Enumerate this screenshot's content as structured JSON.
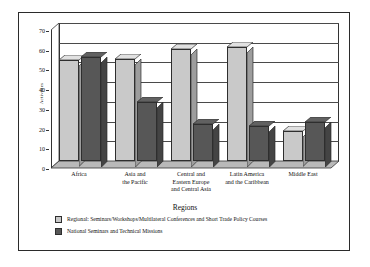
{
  "chart_data": {
    "type": "bar",
    "title": "",
    "xlabel": "Regions",
    "ylabel": "Activities",
    "ylim": [
      0,
      70
    ],
    "yticks": [
      0,
      10,
      20,
      30,
      40,
      50,
      60,
      70
    ],
    "grid": true,
    "legend_position": "bottom-left",
    "categories": [
      "Africa",
      "Asia and the Pacific",
      "Central and Eastern Europe and Central Asia",
      "Latin America and the Caribbean",
      "Middle East"
    ],
    "category_lines": [
      [
        "Africa"
      ],
      [
        "Asia and",
        "the Pacific"
      ],
      [
        "Central and",
        "Eastern Europe",
        "and Central Asia"
      ],
      [
        "Latin America",
        "and the Caribbean"
      ],
      [
        "Middle East"
      ]
    ],
    "series": [
      {
        "name": "Regional: Seminars/Workshops/Multilateral Conferences and Short Trade Policy Courses",
        "color": "#c9c9c9",
        "values": [
          51,
          52,
          57,
          58,
          15
        ]
      },
      {
        "name": "National Seminars and Technical Missions",
        "color": "#575757",
        "values": [
          53,
          30,
          19,
          18,
          20
        ]
      }
    ]
  },
  "axis": {
    "y_title": "Activities",
    "x_title": "Regions",
    "tick_labels": [
      "70",
      "60",
      "50",
      "40",
      "30",
      "20",
      "10",
      "0"
    ]
  },
  "legend": {
    "items": [
      {
        "label": "Regional: Seminars/Workshops/Multilateral Conferences and Short Trade Policy Courses",
        "color": "#c9c9c9"
      },
      {
        "label": "National Seminars and Technical Missions",
        "color": "#575757"
      }
    ]
  },
  "colors": {
    "regional": "#c9c9c9",
    "national": "#575757",
    "axis": "#333333",
    "border": "#2b2b2b",
    "background": "#ffffff"
  }
}
